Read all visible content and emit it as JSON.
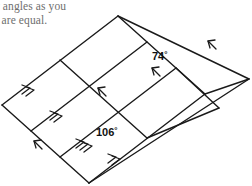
{
  "page": {
    "background_color": "#ffffff",
    "width": 252,
    "height": 186
  },
  "prompt": {
    "line1": "v angles as you",
    "line2": "s are equal.",
    "color": "#6e6e6e"
  },
  "figure": {
    "name": "parallelogram-grid",
    "stroke_color": "#1a1a1a",
    "stroke_width": 1.4,
    "fill": "none",
    "columns": 3,
    "rows": 2,
    "outer_vertices": {
      "left": [
        2,
        105
      ],
      "top": [
        118,
        16
      ],
      "right": [
        249,
        79
      ],
      "bottom": [
        89,
        183
      ]
    },
    "angles": [
      {
        "name": "angle-74",
        "value": "74",
        "degree_symbol": "°",
        "label": "74°",
        "x": 158,
        "y": 56
      },
      {
        "name": "angle-106",
        "value": "106",
        "degree_symbol": "°",
        "label": "106°",
        "x": 101,
        "y": 132
      }
    ],
    "arrow_marks": {
      "single_chevron_count": 3,
      "double_chevron_count": 4,
      "triple_chevron_count": 1,
      "note": "Chevron tick marks indicate sets of parallel segments"
    }
  }
}
